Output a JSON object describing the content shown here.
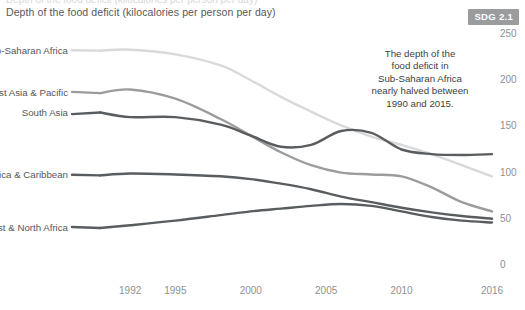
{
  "header": {
    "title": "Depth of the food deficit (kilocalories per person per day)",
    "badge": "SDG 2.1",
    "badge_color": "#9a9c9e",
    "clipped_top_text": "Depth of the food deficit (kilocalories per person per day)"
  },
  "annotation": {
    "text": "The depth of the\nfood deficit in\nSub-Saharan Africa\nnearly halved between\n1990 and 2015."
  },
  "chart_data": {
    "type": "line",
    "title": "Depth of the food deficit (kilocalories per person per day)",
    "xlabel": "",
    "ylabel": "",
    "xlim": [
      1990,
      2016
    ],
    "ylim": [
      0,
      250
    ],
    "grid": false,
    "legend_position": "inline-left-labels",
    "y_ticks": [
      0,
      50,
      100,
      150,
      200,
      250
    ],
    "y_tick_labels": [
      "0",
      "50",
      "100",
      "150",
      "200",
      "250"
    ],
    "x_ticks": [
      1992,
      1995,
      2000,
      2005,
      2010,
      2016
    ],
    "x_tick_labels": [
      "1992",
      "1995",
      "2000",
      "2005",
      "2010",
      "2016"
    ],
    "x": [
      1990,
      1992,
      1995,
      1998,
      2000,
      2002,
      2004,
      2006,
      2008,
      2010,
      2012,
      2014,
      2016
    ],
    "series": [
      {
        "name": "Sub-Saharan Africa",
        "color": "#d8d9da",
        "label_y": 232,
        "values": [
          232,
          233,
          228,
          216,
          200,
          182,
          166,
          151,
          139,
          130,
          120,
          108,
          96
        ]
      },
      {
        "name": "East Asia & Pacific",
        "color": "#9a9c9e",
        "label_y": 186,
        "values": [
          186,
          190,
          180,
          158,
          140,
          122,
          108,
          100,
          98,
          96,
          84,
          68,
          58
        ]
      },
      {
        "name": "South Asia",
        "color": "#5a5d5f",
        "label_y": 165,
        "values": [
          165,
          160,
          160,
          152,
          140,
          128,
          130,
          145,
          143,
          125,
          120,
          119,
          120
        ]
      },
      {
        "name": "Latin America & Caribbean",
        "color": "#5a5d5f",
        "label_y": 97,
        "values": [
          97,
          99,
          98,
          96,
          93,
          88,
          82,
          74,
          68,
          62,
          57,
          53,
          50
        ]
      },
      {
        "name": "Middle East & North Africa",
        "color": "#5a5d5f",
        "label_y": 40,
        "values": [
          40,
          43,
          48,
          54,
          58,
          61,
          64,
          66,
          64,
          58,
          52,
          48,
          46
        ]
      }
    ]
  }
}
